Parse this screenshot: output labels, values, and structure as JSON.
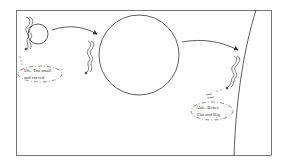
{
  "diagram": {
    "stages": [
      {
        "id": "small-sphere",
        "caption_line1": "Uh.. Too small",
        "caption_line2": "and curved"
      },
      {
        "id": "large-sphere"
      },
      {
        "id": "flat-surface",
        "caption_line1": "Ahh.. Better",
        "caption_line2": "Flat and Big"
      }
    ],
    "colors": {
      "stroke": "#333333",
      "background": "#ffffff"
    }
  }
}
